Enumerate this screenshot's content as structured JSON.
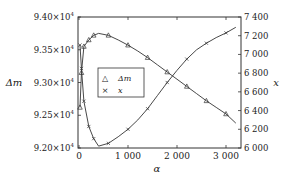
{
  "chart_data": {
    "type": "line",
    "title": "",
    "xlabel": "α",
    "ylabel_left": "Δm",
    "ylabel_right": "x",
    "xlim": [
      0,
      3300
    ],
    "ylim_left": [
      92000,
      94000
    ],
    "ylim_right": [
      6000,
      7400
    ],
    "x_ticks": [
      0,
      1000,
      2000,
      3000
    ],
    "x_tick_labels": [
      "0",
      "1 000",
      "2 000",
      "3 000"
    ],
    "y_left_ticks": [
      92000,
      92500,
      93000,
      93500,
      94000
    ],
    "y_left_tick_labels": [
      "9.20×10⁴",
      "9.25×10⁴",
      "9.30×10⁴",
      "9.35×10⁴",
      "9.40×10⁴"
    ],
    "y_right_ticks": [
      6000,
      6200,
      6400,
      6600,
      6800,
      7000,
      7200,
      7400
    ],
    "y_right_tick_labels": [
      "6 000",
      "6 200",
      "6 400",
      "6 600",
      "6 800",
      "7 000",
      "7 200",
      "7 400"
    ],
    "grid": false,
    "legend_position": "center-left",
    "series": [
      {
        "name": "Δm",
        "axis": "left",
        "marker": "triangle",
        "x": [
          20,
          50,
          100,
          200,
          300,
          400,
          600,
          800,
          1000,
          1200,
          1400,
          1600,
          1800,
          2000,
          2200,
          2400,
          2600,
          2800,
          3000,
          3200
        ],
        "y": [
          92620,
          93150,
          93550,
          93650,
          93720,
          93750,
          93720,
          93650,
          93570,
          93480,
          93380,
          93270,
          93160,
          93050,
          92940,
          92830,
          92720,
          92620,
          92520,
          92380
        ]
      },
      {
        "name": "x",
        "axis": "right",
        "marker": "x",
        "x": [
          20,
          50,
          100,
          200,
          300,
          400,
          600,
          800,
          1000,
          1200,
          1400,
          1600,
          1800,
          2000,
          2200,
          2400,
          2600,
          2800,
          3000,
          3200
        ],
        "y": [
          7100,
          6850,
          6500,
          6230,
          6100,
          6020,
          6050,
          6120,
          6200,
          6300,
          6420,
          6560,
          6700,
          6830,
          6950,
          7050,
          7120,
          7180,
          7230,
          7290
        ]
      }
    ]
  },
  "legend": {
    "items": [
      {
        "marker": "△",
        "label": "Δm"
      },
      {
        "marker": "×",
        "label": "x"
      }
    ]
  }
}
